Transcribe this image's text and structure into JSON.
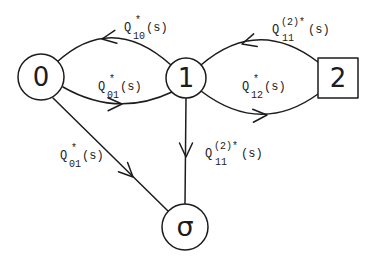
{
  "diagram": {
    "background": "#ffffff",
    "stroke_color": "#1c1c1c",
    "nodes": [
      {
        "id": "0",
        "label": "0",
        "shape": "circle"
      },
      {
        "id": "1",
        "label": "1",
        "shape": "circle"
      },
      {
        "id": "2",
        "label": "2",
        "shape": "square"
      },
      {
        "id": "sigma",
        "label": "σ",
        "shape": "circle"
      }
    ],
    "edges": [
      {
        "from": "1",
        "to": "0",
        "label": {
          "q": "Q",
          "sup": "*",
          "sub": "10",
          "tail": "(s)"
        }
      },
      {
        "from": "0",
        "to": "1",
        "label": {
          "q": "Q",
          "sup": "*",
          "sub": "01",
          "tail": "(s)"
        }
      },
      {
        "from": "2",
        "to": "1",
        "label": {
          "q": "Q",
          "sup": "(2)*",
          "sub": "11",
          "tail": "(s)"
        }
      },
      {
        "from": "1",
        "to": "2",
        "label": {
          "q": "Q",
          "sup": "*",
          "sub": "12",
          "tail": "(s)"
        }
      },
      {
        "from": "0",
        "to": "sigma",
        "label": {
          "q": "Q",
          "sup": "*",
          "sub": "01",
          "tail": "(s)"
        }
      },
      {
        "from": "1",
        "to": "sigma",
        "label": {
          "q": "Q",
          "sup": "(2)*",
          "sub": "11",
          "tail": "(s)"
        }
      }
    ]
  }
}
